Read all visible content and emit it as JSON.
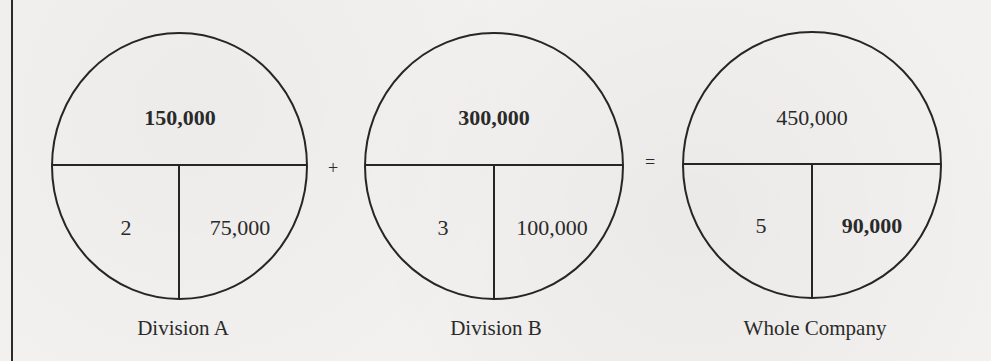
{
  "diagram": {
    "title": "",
    "operators": {
      "plus": "+",
      "equals": "="
    },
    "circles": [
      {
        "name": "Division A",
        "top_value": "150,000",
        "top_bold": true,
        "bottom_left": "2",
        "bottom_left_bold": false,
        "bottom_right": "75,000",
        "bottom_right_bold": false
      },
      {
        "name": "Division B",
        "top_value": "300,000",
        "top_bold": true,
        "bottom_left": "3",
        "bottom_left_bold": false,
        "bottom_right": "100,000",
        "bottom_right_bold": false
      },
      {
        "name": "Whole Company",
        "top_value": "450,000",
        "top_bold": false,
        "bottom_left": "5",
        "bottom_left_bold": false,
        "bottom_right": "90,000",
        "bottom_right_bold": true
      }
    ],
    "colors": {
      "ink": "#2a2a2a",
      "paper": "#f2f1ef"
    }
  }
}
